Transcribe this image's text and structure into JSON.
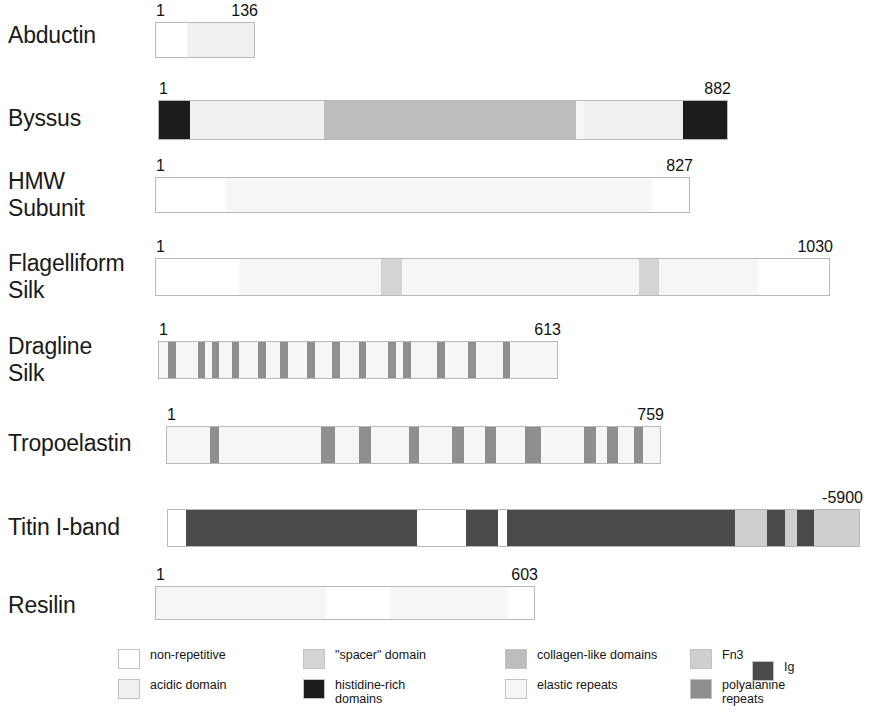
{
  "figure": {
    "background": "#ffffff"
  },
  "colors": {
    "non_repetitive": "#ffffff",
    "acidic_domain": "#f0f0ee",
    "spacer_domain": "#d4d4d2",
    "histidine_rich": "#1c1c1c",
    "collagen_like": "#bdbdbb",
    "elastic_repeats": "#f6f6f4",
    "fn3": "#cfcfcd",
    "polyalanine_repeats": "#8f8f8d",
    "ig": "#4a4a4a",
    "outline": "#b9b9b9",
    "text": "#1a1a1a"
  },
  "rows": [
    {
      "name": "abductin",
      "label": "Abductin",
      "start_label": "1",
      "end_label": "136",
      "segments": [
        {
          "type": "non_repetitive",
          "width": 6
        },
        {
          "type": "acidic_domain",
          "width": 13
        }
      ]
    },
    {
      "name": "byssus",
      "label": "Byssus",
      "start_label": "1",
      "end_label": "882",
      "segments": [
        {
          "type": "histidine_rich",
          "width": 4.2
        },
        {
          "type": "acidic_domain",
          "width": 18.5
        },
        {
          "type": "collagen_like",
          "width": 34.5
        },
        {
          "type": "elastic_repeats",
          "width": 1.2
        },
        {
          "type": "acidic_domain",
          "width": 13.6
        },
        {
          "type": "histidine_rich",
          "width": 6.0
        }
      ]
    },
    {
      "name": "hmw-subunit",
      "label": "HMW\nSubunit",
      "start_label": "1",
      "end_label": "827",
      "segments": [
        {
          "type": "non_repetitive",
          "width": 8.5
        },
        {
          "type": "elastic_repeats",
          "width": 51.5
        },
        {
          "type": "non_repetitive",
          "width": 4.5
        }
      ]
    },
    {
      "name": "flagelliform-silk",
      "label": "Flagelliform\nSilk",
      "start_label": "1",
      "end_label": "1030",
      "segments": [
        {
          "type": "non_repetitive",
          "width": 10.5
        },
        {
          "type": "elastic_repeats",
          "width": 18.0
        },
        {
          "type": "spacer_domain",
          "width": 2.6
        },
        {
          "type": "elastic_repeats",
          "width": 30.0
        },
        {
          "type": "spacer_domain",
          "width": 2.6
        },
        {
          "type": "elastic_repeats",
          "width": 12.5
        },
        {
          "type": "non_repetitive",
          "width": 9.0
        }
      ]
    },
    {
      "name": "dragline-silk",
      "label": "Dragline\nSilk",
      "start_label": "1",
      "end_label": "613",
      "segments": [
        {
          "type": "elastic_repeats",
          "width": 2.2
        },
        {
          "type": "polyalanine_repeats",
          "width": 1.9
        },
        {
          "type": "elastic_repeats",
          "width": 5.4
        },
        {
          "type": "polyalanine_repeats",
          "width": 1.9
        },
        {
          "type": "elastic_repeats",
          "width": 1.6
        },
        {
          "type": "polyalanine_repeats",
          "width": 1.9
        },
        {
          "type": "elastic_repeats",
          "width": 3.0
        },
        {
          "type": "polyalanine_repeats",
          "width": 1.9
        },
        {
          "type": "elastic_repeats",
          "width": 4.6
        },
        {
          "type": "polyalanine_repeats",
          "width": 1.9
        },
        {
          "type": "elastic_repeats",
          "width": 3.6
        },
        {
          "type": "polyalanine_repeats",
          "width": 1.9
        },
        {
          "type": "elastic_repeats",
          "width": 4.8
        },
        {
          "type": "polyalanine_repeats",
          "width": 1.9
        },
        {
          "type": "elastic_repeats",
          "width": 4.2
        },
        {
          "type": "polyalanine_repeats",
          "width": 1.9
        },
        {
          "type": "elastic_repeats",
          "width": 4.6
        },
        {
          "type": "polyalanine_repeats",
          "width": 1.9
        },
        {
          "type": "elastic_repeats",
          "width": 5.4
        },
        {
          "type": "polyalanine_repeats",
          "width": 1.9
        },
        {
          "type": "elastic_repeats",
          "width": 1.8
        },
        {
          "type": "polyalanine_repeats",
          "width": 1.9
        },
        {
          "type": "elastic_repeats",
          "width": 6.4
        },
        {
          "type": "polyalanine_repeats",
          "width": 1.9
        },
        {
          "type": "elastic_repeats",
          "width": 5.8
        },
        {
          "type": "polyalanine_repeats",
          "width": 1.9
        },
        {
          "type": "elastic_repeats",
          "width": 6.6
        },
        {
          "type": "polyalanine_repeats",
          "width": 1.9
        },
        {
          "type": "elastic_repeats",
          "width": 11.4
        }
      ]
    },
    {
      "name": "tropoelastin",
      "label": "Tropoelastin",
      "start_label": "1",
      "end_label": "759",
      "segments": [
        {
          "type": "elastic_repeats",
          "width": 9.0
        },
        {
          "type": "polyalanine_repeats",
          "width": 2.0
        },
        {
          "type": "elastic_repeats",
          "width": 21.5
        },
        {
          "type": "polyalanine_repeats",
          "width": 3.0
        },
        {
          "type": "elastic_repeats",
          "width": 5.0
        },
        {
          "type": "polyalanine_repeats",
          "width": 2.6
        },
        {
          "type": "elastic_repeats",
          "width": 8.0
        },
        {
          "type": "polyalanine_repeats",
          "width": 2.0
        },
        {
          "type": "elastic_repeats",
          "width": 7.0
        },
        {
          "type": "polyalanine_repeats",
          "width": 2.6
        },
        {
          "type": "elastic_repeats",
          "width": 4.4
        },
        {
          "type": "polyalanine_repeats",
          "width": 2.4
        },
        {
          "type": "elastic_repeats",
          "width": 6.0
        },
        {
          "type": "polyalanine_repeats",
          "width": 3.4
        },
        {
          "type": "elastic_repeats",
          "width": 9.0
        },
        {
          "type": "polyalanine_repeats",
          "width": 2.6
        },
        {
          "type": "elastic_repeats",
          "width": 2.4
        },
        {
          "type": "polyalanine_repeats",
          "width": 2.2
        },
        {
          "type": "elastic_repeats",
          "width": 3.4
        },
        {
          "type": "polyalanine_repeats",
          "width": 2.0
        },
        {
          "type": "elastic_repeats",
          "width": 3.5
        }
      ]
    },
    {
      "name": "titin-i-band",
      "label": "Titin I-band",
      "start_label": "",
      "end_label": "-5900",
      "segments": [
        {
          "type": "non_repetitive",
          "width": 2.6
        },
        {
          "type": "ig",
          "width": 33.5
        },
        {
          "type": "non_repetitive",
          "width": 7.0
        },
        {
          "type": "ig",
          "width": 4.6
        },
        {
          "type": "non_repetitive",
          "width": 1.4
        },
        {
          "type": "ig",
          "width": 33.0
        },
        {
          "type": "fn3",
          "width": 4.6
        },
        {
          "type": "ig",
          "width": 2.6
        },
        {
          "type": "fn3",
          "width": 1.8
        },
        {
          "type": "ig",
          "width": 2.4
        },
        {
          "type": "fn3",
          "width": 6.5
        }
      ]
    },
    {
      "name": "resilin",
      "label": "Resilin",
      "start_label": "1",
      "end_label": "603",
      "segments": [
        {
          "type": "elastic_repeats",
          "width": 45.0
        },
        {
          "type": "non_repetitive",
          "width": 17.0
        },
        {
          "type": "elastic_repeats",
          "width": 31.0
        },
        {
          "type": "non_repetitive",
          "width": 7.0
        }
      ]
    }
  ],
  "legend": [
    {
      "name": "non-repetitive",
      "label": "non-repetitive",
      "type": "non_repetitive"
    },
    {
      "name": "acidic-domain",
      "label": "acidic domain",
      "type": "acidic_domain"
    },
    {
      "name": "spacer-domain",
      "label": "\"spacer\" domain",
      "type": "spacer_domain"
    },
    {
      "name": "histidine-rich-domains",
      "label": "histidine-rich\ndomains",
      "type": "histidine_rich"
    },
    {
      "name": "collagen-like-domains",
      "label": "collagen-like domains",
      "type": "collagen_like"
    },
    {
      "name": "elastic-repeats",
      "label": "elastic repeats",
      "type": "elastic_repeats"
    },
    {
      "name": "fn3",
      "label": "Fn3",
      "type": "fn3"
    },
    {
      "name": "polyalanine-repeats",
      "label": "polyalanine\nrepeats",
      "type": "polyalanine_repeats"
    },
    {
      "name": "ig",
      "label": "Ig",
      "type": "ig"
    }
  ]
}
